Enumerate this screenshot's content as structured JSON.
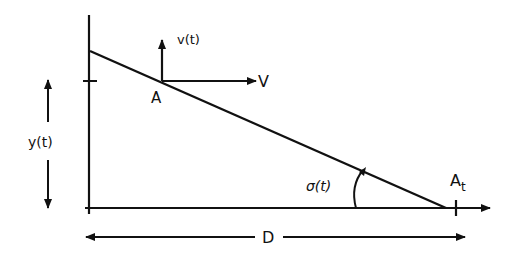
{
  "diagram": {
    "labels": {
      "point_a": "A",
      "point_at": "A",
      "point_at_sub": "t",
      "vertical_velocity": "v(t)",
      "horizontal_velocity": "V",
      "altitude": "y(t)",
      "angle": "σ(t)",
      "distance": "D"
    },
    "colors": {
      "stroke": "#111111",
      "background": "#ffffff"
    }
  }
}
